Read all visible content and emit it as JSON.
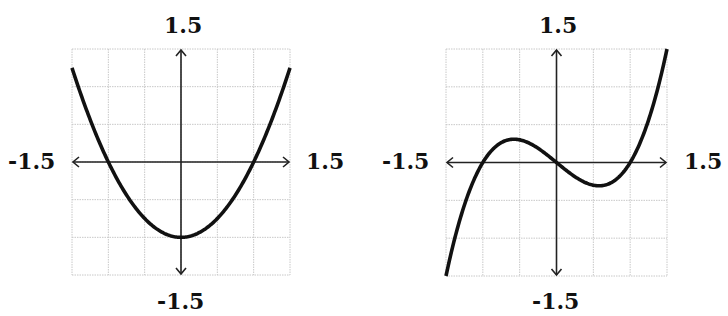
{
  "chart_data": [
    {
      "type": "line",
      "title": "",
      "function": "y = x^2 - 1",
      "xlim": [
        -1.5,
        1.5
      ],
      "ylim": [
        -1.5,
        1.5
      ],
      "grid": true,
      "grid_step": 0.5,
      "labels": {
        "top": "1.5",
        "bottom": "-1.5",
        "left": "-1.5",
        "right": "1.5"
      },
      "x": [
        -1.5,
        -1.25,
        -1.0,
        -0.75,
        -0.5,
        -0.25,
        0,
        0.25,
        0.5,
        0.75,
        1.0,
        1.25,
        1.5
      ],
      "series": [
        {
          "name": "parabola",
          "values": [
            1.25,
            0.5625,
            0,
            -0.4375,
            -0.75,
            -0.9375,
            -1,
            -0.9375,
            -0.75,
            -0.4375,
            0,
            0.5625,
            1.25
          ]
        }
      ],
      "key_points": {
        "vertex": [
          0,
          -1
        ],
        "roots": [
          -1,
          1
        ]
      }
    },
    {
      "type": "line",
      "title": "",
      "function": "y = 0.8 (x^3 - x)",
      "xlim": [
        -1.5,
        1.5
      ],
      "ylim": [
        -1.5,
        1.5
      ],
      "grid": true,
      "grid_step": 0.5,
      "labels": {
        "top": "1.5",
        "bottom": "-1.5",
        "left": "-1.5",
        "right": "1.5"
      },
      "x": [
        -1.5,
        -1.25,
        -1.0,
        -0.75,
        -0.5,
        -0.25,
        0,
        0.25,
        0.5,
        0.75,
        1.0,
        1.25,
        1.5
      ],
      "series": [
        {
          "name": "cubic",
          "values": [
            -1.5,
            -0.5625,
            0,
            0.2625,
            0.3,
            0.1875,
            0,
            -0.1875,
            -0.3,
            -0.2625,
            0,
            0.5625,
            1.5
          ]
        }
      ],
      "key_points": {
        "local_max": [
          -0.58,
          0.31
        ],
        "local_min": [
          0.58,
          -0.31
        ],
        "roots": [
          -1,
          0,
          1
        ]
      }
    }
  ],
  "panels": [
    {
      "top": "1.5",
      "bottom": "-1.5",
      "left": "-1.5",
      "right": "1.5"
    },
    {
      "top": "1.5",
      "bottom": "-1.5",
      "left": "-1.5",
      "right": "1.5"
    }
  ],
  "colors": {
    "curve": "#111111",
    "axis": "#222222",
    "grid": "#c8c8c8"
  }
}
